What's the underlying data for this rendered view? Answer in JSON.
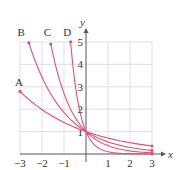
{
  "chart_data": {
    "type": "line",
    "title": "",
    "xlabel": "x",
    "ylabel": "y",
    "xlim": [
      -3,
      3
    ],
    "ylim": [
      0,
      5
    ],
    "grid": true,
    "x_ticks": [
      "-3",
      "-2",
      "-1",
      "1",
      "2",
      "3"
    ],
    "y_ticks": [
      "1",
      "2",
      "3",
      "4",
      "5"
    ],
    "series": [
      {
        "name": "A",
        "formula": "y = (0.71)^x",
        "base": 0.71,
        "x_start": -3,
        "x_end": 3,
        "points": [
          [
            -3,
            2.8
          ],
          [
            -2,
            1.98
          ],
          [
            -1,
            1.41
          ],
          [
            0,
            1
          ],
          [
            1,
            0.71
          ],
          [
            2,
            0.5
          ],
          [
            3,
            0.36
          ]
        ]
      },
      {
        "name": "B",
        "formula": "y = (0.54)^x",
        "base": 0.54,
        "x_start": -2.6,
        "x_end": 3,
        "points": [
          [
            -2.6,
            5
          ],
          [
            -2,
            3.43
          ],
          [
            -1,
            1.85
          ],
          [
            0,
            1
          ],
          [
            1,
            0.54
          ],
          [
            2,
            0.29
          ],
          [
            3,
            0.16
          ]
        ]
      },
      {
        "name": "C",
        "formula": "y = (0.37)^x",
        "base": 0.37,
        "x_start": -1.6,
        "x_end": 3,
        "points": [
          [
            -1.6,
            5
          ],
          [
            -1,
            2.72
          ],
          [
            0,
            1
          ],
          [
            1,
            0.37
          ],
          [
            2,
            0.14
          ],
          [
            3,
            0.05
          ]
        ]
      },
      {
        "name": "D",
        "formula": "y = (0.1)^x",
        "base": 0.1,
        "x_start": -0.7,
        "x_end": 3,
        "points": [
          [
            -0.7,
            5
          ],
          [
            -0.5,
            3.16
          ],
          [
            0,
            1
          ],
          [
            0.5,
            0.32
          ],
          [
            1,
            0.1
          ],
          [
            2,
            0.01
          ],
          [
            3,
            0.001
          ]
        ]
      }
    ],
    "curve_color": "#e0507a",
    "grid_color": "#d8d8d8",
    "axis_color": "#555555"
  }
}
